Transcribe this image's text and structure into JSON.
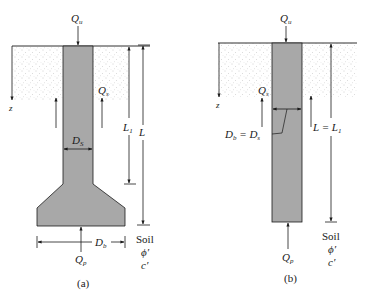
{
  "figure_a": {
    "caption": "(a)",
    "load_top": "Q",
    "load_top_sub": "u",
    "skin_label": "Q",
    "skin_sub": "s",
    "shaft_dia": "D",
    "shaft_dia_sub": "S",
    "length_1": "L",
    "length_1_sub": "1",
    "length_total": "L",
    "base_dia": "D",
    "base_dia_sub": "b",
    "tip_load": "Q",
    "tip_load_sub": "p",
    "depth_axis": "z",
    "soil_label": "Soil",
    "soil_phi": "ϕ′",
    "soil_c": "c′"
  },
  "figure_b": {
    "caption": "(b)",
    "load_top": "Q",
    "load_top_sub": "u",
    "skin_label": "Q",
    "skin_sub": "s",
    "dia_eq": "D",
    "dia_eq_sub_b": "b",
    "dia_eq_mid": " = D",
    "dia_eq_sub_s": "s",
    "length_eq": "L = L",
    "length_eq_sub": "1",
    "tip_load": "Q",
    "tip_load_sub": "p",
    "depth_axis": "z",
    "soil_label": "Soil",
    "soil_phi": "ϕ′",
    "soil_c": "c′"
  },
  "colors": {
    "pile_fill": "#a8a8a8",
    "line": "#1a1a1a",
    "soil_dot": "#9a9a9a"
  }
}
